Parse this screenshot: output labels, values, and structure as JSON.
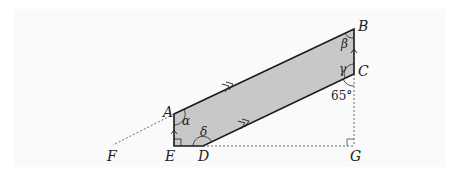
{
  "diagram": {
    "type": "geometry",
    "points": {
      "A": {
        "label": "A",
        "x": 174,
        "y": 114
      },
      "B": {
        "label": "B",
        "x": 354,
        "y": 29
      },
      "C": {
        "label": "C",
        "x": 354,
        "y": 74
      },
      "D": {
        "label": "D",
        "x": 203,
        "y": 146
      },
      "E": {
        "label": "E",
        "x": 174,
        "y": 146
      },
      "F": {
        "label": "F",
        "x": 113,
        "y": 145
      },
      "G": {
        "label": "G",
        "x": 354,
        "y": 146
      }
    },
    "angles": {
      "alpha": "α",
      "beta": "β",
      "gamma": "γ",
      "delta": "δ",
      "given": "65°"
    },
    "fill_color": "#c8c8c8",
    "stroke_color": "#1a1a1a",
    "background_color": "#fafafa"
  }
}
